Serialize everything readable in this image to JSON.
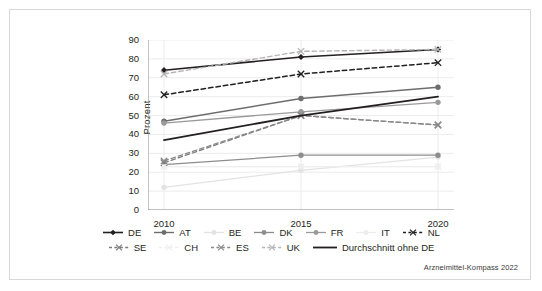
{
  "figure": {
    "source_note": "Arzneimittel-Kompass 2022"
  },
  "chart_data": {
    "type": "line",
    "title": "",
    "xlabel": "",
    "ylabel": "Prozent",
    "x": [
      "2010",
      "2015",
      "2020"
    ],
    "categories": [
      "2010",
      "2015",
      "2020"
    ],
    "ylim": [
      0,
      90
    ],
    "yticks": [
      0,
      10,
      20,
      30,
      40,
      50,
      60,
      70,
      80,
      90
    ],
    "ytick_labels": [
      "0",
      "10",
      "20",
      "30",
      "40",
      "50",
      "60",
      "70",
      "80",
      "90"
    ],
    "grid": true,
    "legend_position": "bottom",
    "series": [
      {
        "name": "DE",
        "values": [
          74,
          81,
          85
        ],
        "color": "#231f20",
        "line_style": "solid",
        "marker": "diamond",
        "width": 1.6
      },
      {
        "name": "AT",
        "values": [
          47,
          59,
          65
        ],
        "color": "#6d6d6d",
        "line_style": "solid",
        "marker": "circle",
        "width": 1.4
      },
      {
        "name": "BE",
        "values": [
          12,
          21,
          28
        ],
        "color": "#e3e3e3",
        "line_style": "solid",
        "marker": "circle",
        "width": 1.4
      },
      {
        "name": "DK",
        "values": [
          24,
          29,
          29
        ],
        "color": "#8d8d8d",
        "line_style": "solid",
        "marker": "circle",
        "width": 1.3
      },
      {
        "name": "FR",
        "values": [
          46,
          52,
          57
        ],
        "color": "#9a9a9a",
        "line_style": "solid",
        "marker": "circle",
        "width": 1.3
      },
      {
        "name": "IT",
        "values": [
          23,
          23,
          23
        ],
        "color": "#ededed",
        "line_style": "solid",
        "marker": "circle",
        "width": 1.2
      },
      {
        "name": "NL",
        "values": [
          61,
          72,
          78
        ],
        "color": "#231f20",
        "line_style": "dashed",
        "marker": "x",
        "width": 1.5
      },
      {
        "name": "SE",
        "values": [
          25,
          50,
          45
        ],
        "color": "#7c7c7c",
        "line_style": "dashed",
        "marker": "x",
        "width": 1.3
      },
      {
        "name": "CH",
        "values": [
          23,
          23,
          23
        ],
        "color": "#efefef",
        "line_style": "dashed",
        "marker": "x",
        "width": 1.2
      },
      {
        "name": "ES",
        "values": [
          26,
          50,
          45
        ],
        "color": "#8a8a8a",
        "line_style": "dashed",
        "marker": "x",
        "width": 1.3
      },
      {
        "name": "UK",
        "values": [
          72,
          84,
          85
        ],
        "color": "#b5b5b5",
        "line_style": "dashed",
        "marker": "x",
        "width": 1.4
      },
      {
        "name": "Durchschnitt ohne DE",
        "values": [
          37,
          50,
          60
        ],
        "color": "#231f20",
        "line_style": "solid",
        "marker": "none",
        "width": 1.8
      }
    ]
  },
  "legend": {
    "rows": [
      [
        "DE",
        "AT",
        "BE",
        "DK",
        "FR",
        "IT",
        "NL"
      ],
      [
        "SE",
        "CH",
        "ES",
        "UK",
        "Durchschnitt ohne DE"
      ]
    ]
  }
}
